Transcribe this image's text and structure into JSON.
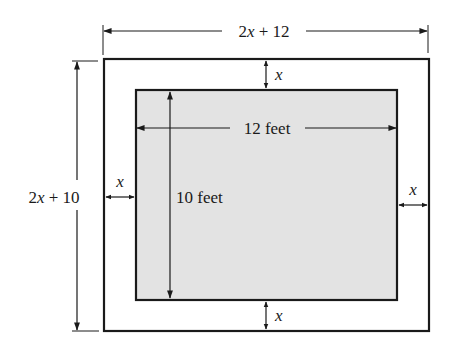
{
  "diagram": {
    "type": "area-border-figure",
    "colors": {
      "line": "#1a1a1a",
      "inner_fill": "#e3e3e3",
      "background": "#ffffff"
    },
    "outer": {
      "width_label_var": "2x",
      "width_label_rest": " + 12",
      "height_label_var": "2x",
      "height_label_rest": " + 10"
    },
    "inner": {
      "width_label": "12 feet",
      "height_label": "10 feet"
    },
    "border": {
      "top_label": "x",
      "bottom_label": "x",
      "left_label": "x",
      "right_label": "x"
    }
  }
}
